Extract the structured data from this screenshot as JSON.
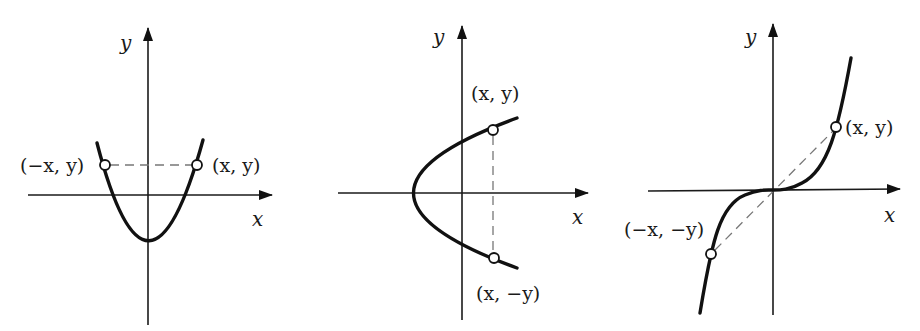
{
  "figures": [
    {
      "id": "even-function",
      "description": "Parabola symmetric about the y-axis",
      "axis_labels": {
        "x": "x",
        "y": "y"
      },
      "points": [
        {
          "label": "(−x, y)"
        },
        {
          "label": "(x, y)"
        }
      ]
    },
    {
      "id": "x-axis-symmetry",
      "description": "Sideways parabola symmetric about the x-axis",
      "axis_labels": {
        "x": "x",
        "y": "y"
      },
      "points": [
        {
          "label": "(x, y)"
        },
        {
          "label": "(x, −y)"
        }
      ]
    },
    {
      "id": "odd-function",
      "description": "Cubic curve symmetric about the origin",
      "axis_labels": {
        "x": "x",
        "y": "y"
      },
      "points": [
        {
          "label": "(x, y)"
        },
        {
          "label": "(−x, −y)"
        }
      ]
    }
  ]
}
